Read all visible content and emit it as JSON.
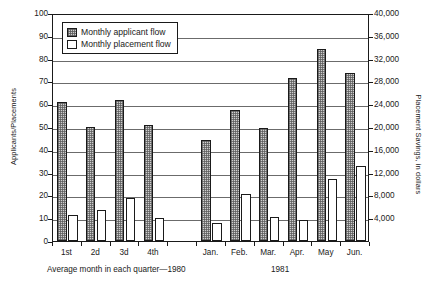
{
  "chart_data": {
    "type": "bar",
    "title": "",
    "subtitle": "",
    "xlabel": "",
    "ylabel": "Applicants/Placements",
    "y2label": "Placement Savings, in dollars",
    "grid": true,
    "legend_position": "top-left",
    "categories": [
      "1st",
      "2d",
      "3d",
      "4th",
      "Jan.",
      "Feb.",
      "Mar.",
      "Apr.",
      "May",
      "Jun."
    ],
    "series": [
      {
        "name": "Monthly applicant flow",
        "values": [
          61,
          50,
          62,
          51,
          44.5,
          57.5,
          49.5,
          71.5,
          84,
          73.5
        ]
      },
      {
        "name": "Monthly placement flow",
        "values": [
          11.5,
          13.5,
          19,
          10,
          8,
          20.5,
          10.5,
          9,
          27,
          33
        ]
      }
    ],
    "ylim": [
      0,
      100
    ],
    "yticks": [
      0,
      10,
      20,
      30,
      40,
      50,
      60,
      70,
      80,
      90,
      100
    ],
    "ytick_labels": [
      "0",
      "10",
      "20",
      "30",
      "40",
      "50",
      "60",
      "70",
      "80",
      "90",
      "100"
    ],
    "y2lim": [
      0,
      40000
    ],
    "y2ticks": [
      4000,
      8000,
      12000,
      16000,
      20000,
      24000,
      28000,
      32000,
      36000,
      40000
    ],
    "y2tick_labels": [
      "4,000",
      "8,000",
      "12,000",
      "16,000",
      "20,000",
      "24,000",
      "28,000",
      "32,000",
      "36,000",
      "40,000"
    ],
    "annotations": [
      "Average month in each quarter—1980",
      "1981"
    ]
  },
  "legend": {
    "items": [
      {
        "label": "Monthly applicant flow",
        "swatch": "hatched-gray"
      },
      {
        "label": "Monthly placement flow",
        "swatch": "white"
      }
    ]
  },
  "captions": {
    "left": "Average month in each quarter—1980",
    "right": "1981"
  }
}
